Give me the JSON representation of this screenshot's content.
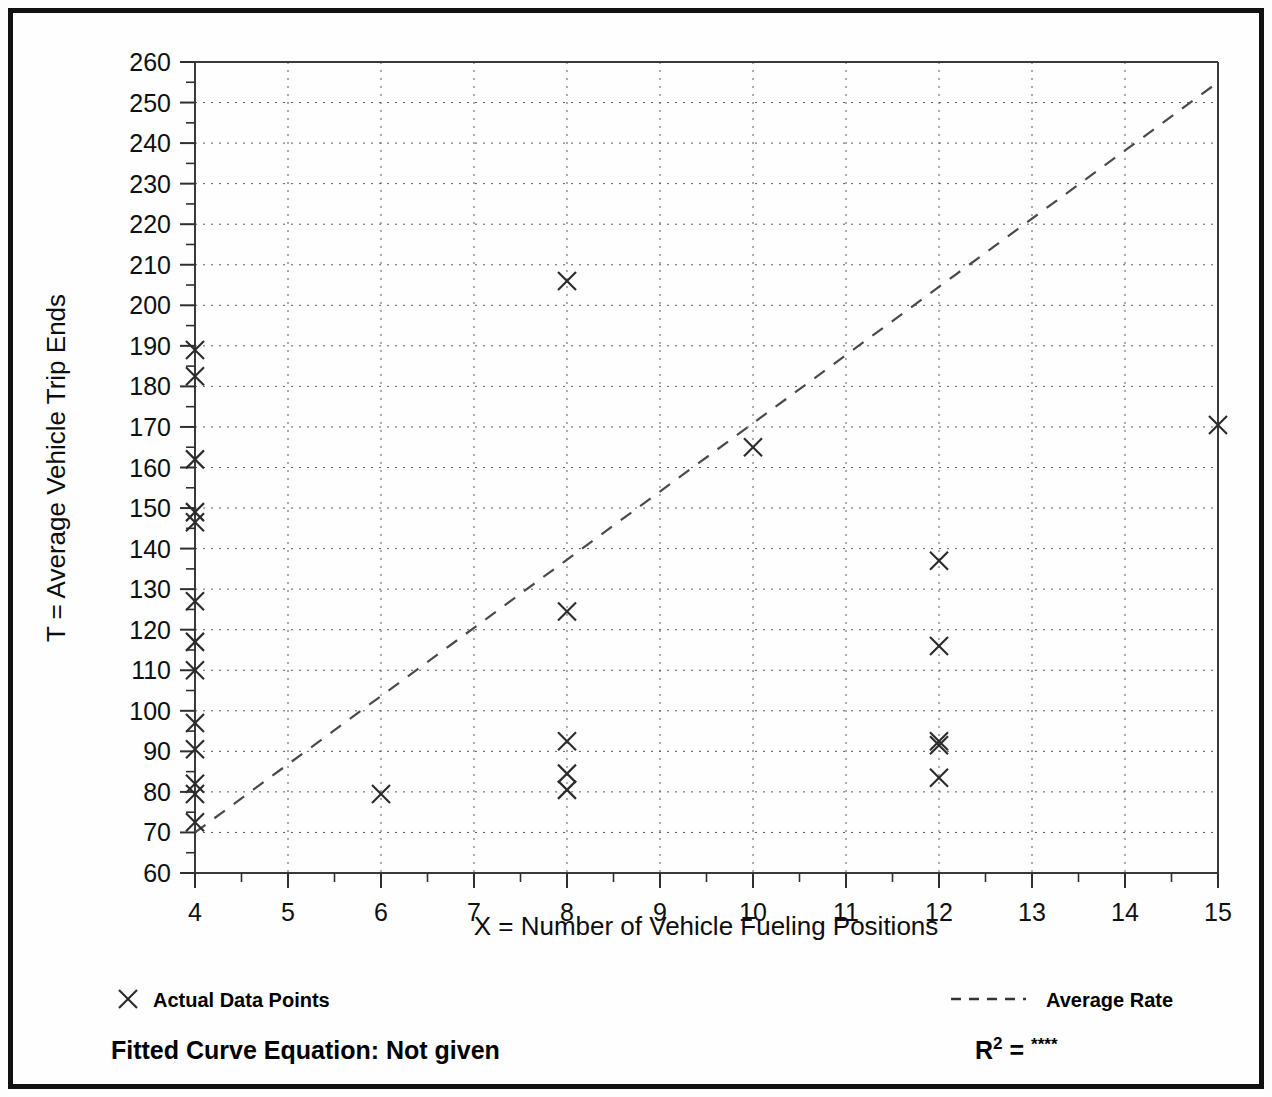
{
  "chart_data": {
    "type": "scatter",
    "title": "",
    "xlabel": "X = Number of Vehicle Fueling Positions",
    "ylabel": "T = Average Vehicle Trip Ends",
    "xlim": [
      4,
      15
    ],
    "ylim": [
      60,
      260
    ],
    "xticks": [
      4,
      5,
      6,
      7,
      8,
      9,
      10,
      11,
      12,
      13,
      14,
      15
    ],
    "yticks": [
      60,
      70,
      80,
      90,
      100,
      110,
      120,
      130,
      140,
      150,
      160,
      170,
      180,
      190,
      200,
      210,
      220,
      230,
      240,
      250,
      260
    ],
    "xtick_labels": [
      "4",
      "5",
      "6",
      "7",
      "8",
      "9",
      "10",
      "11",
      "12",
      "13",
      "14",
      "15"
    ],
    "ytick_labels": [
      "60",
      "70",
      "80",
      "90",
      "100",
      "110",
      "120",
      "130",
      "140",
      "150",
      "160",
      "170",
      "180",
      "190",
      "200",
      "210",
      "220",
      "230",
      "240",
      "250",
      "260"
    ],
    "x_minor_step": 0.5,
    "y_minor_step": 5,
    "grid": true,
    "grid_style": "dotted",
    "legend_position": "below-plot",
    "series": [
      {
        "name": "Actual Data Points",
        "marker": "x",
        "points": [
          [
            4,
            189
          ],
          [
            4,
            182.5
          ],
          [
            4,
            162
          ],
          [
            4,
            149
          ],
          [
            4,
            146.5
          ],
          [
            4,
            127
          ],
          [
            4,
            117
          ],
          [
            4,
            110
          ],
          [
            4,
            97
          ],
          [
            4,
            90.5
          ],
          [
            4,
            82
          ],
          [
            4,
            79.5
          ],
          [
            4,
            72.5
          ],
          [
            6,
            79.5
          ],
          [
            8,
            206
          ],
          [
            8,
            124.5
          ],
          [
            8,
            92.5
          ],
          [
            8,
            84.5
          ],
          [
            8,
            80.5
          ],
          [
            10,
            165
          ],
          [
            12,
            137
          ],
          [
            12,
            116
          ],
          [
            12,
            92.5
          ],
          [
            12,
            91.5
          ],
          [
            12,
            83.5
          ],
          [
            15,
            170.5
          ]
        ]
      },
      {
        "name": "Average Rate",
        "marker": "dashed-line",
        "points": [
          [
            4,
            70
          ],
          [
            15,
            255
          ]
        ]
      }
    ]
  },
  "legend": {
    "data_points_label": "Actual Data Points",
    "average_rate_label": "Average Rate"
  },
  "footer": {
    "fitted_curve_label": "Fitted Curve Equation:  Not given",
    "r_squared_base": "R",
    "r_squared_exponent": "2",
    "r_squared_equals": " = ",
    "r_squared_value": "****"
  },
  "colors": {
    "frame": "#111111",
    "axis": "#3a3a3a",
    "grid": "#5a5a5a",
    "marker": "#2b2b2b",
    "trend": "#4a4a4a",
    "text": "#000000",
    "background": "#fdfdfd"
  }
}
